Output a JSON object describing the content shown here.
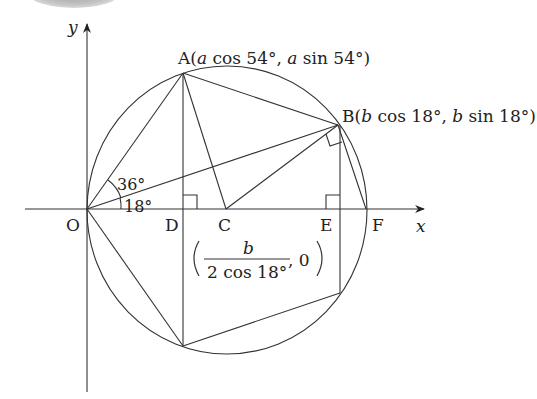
{
  "diagram": {
    "axes": {
      "x_label": "x",
      "y_label": "y"
    },
    "points": {
      "O": {
        "label": "O"
      },
      "A": {
        "label": "A",
        "coord_open": "(",
        "coord_a1": "a",
        "coord_t1": " cos 54°, ",
        "coord_a2": "a",
        "coord_t2": " sin 54°)"
      },
      "B": {
        "label": "B",
        "coord_open": "(",
        "coord_a1": "b",
        "coord_t1": " cos 18°, ",
        "coord_a2": "b",
        "coord_t2": " sin 18°)"
      },
      "C": {
        "label": "C",
        "coord_numerator": "b",
        "coord_denominator": "2 cos 18°",
        "coord_tail": ", 0"
      },
      "D": {
        "label": "D"
      },
      "E": {
        "label": "E"
      },
      "F": {
        "label": "F"
      }
    },
    "angles": {
      "angle_AOB": "36°",
      "angle_BOF": "18°"
    },
    "colors": {
      "stroke": "#333333",
      "text": "#222222",
      "background": "#ffffff"
    }
  }
}
